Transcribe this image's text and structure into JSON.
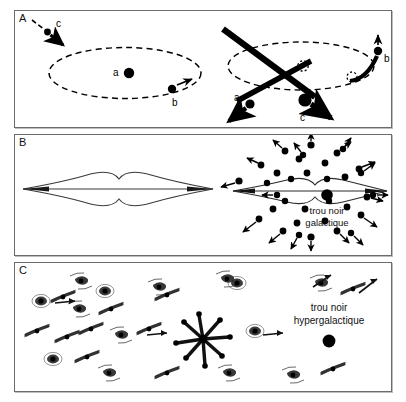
{
  "figure": {
    "background": "#ffffff",
    "frame_color": "#6b6b6b",
    "ink_color": "#000000"
  },
  "panels": [
    {
      "id": "A",
      "label": "A",
      "scene": "stellar",
      "markers": [
        {
          "key": "a_left",
          "label": "a",
          "role": "central-mass"
        },
        {
          "key": "b_left",
          "label": "b",
          "role": "orbiting-body"
        },
        {
          "key": "c_left",
          "label": "c",
          "role": "incoming-body"
        },
        {
          "key": "a_right",
          "label": "a",
          "role": "ejected-mass"
        },
        {
          "key": "b_right",
          "label": "b",
          "role": "escaping-body"
        },
        {
          "key": "c_right",
          "label": "c",
          "role": "intruder-body"
        }
      ]
    },
    {
      "id": "B",
      "label": "B",
      "scene": "galactic",
      "caption_lines": [
        "trou noir",
        "galactique"
      ]
    },
    {
      "id": "C",
      "label": "C",
      "scene": "hypergalactic",
      "caption_lines": [
        "trou noir",
        "hypergalactique"
      ]
    }
  ]
}
